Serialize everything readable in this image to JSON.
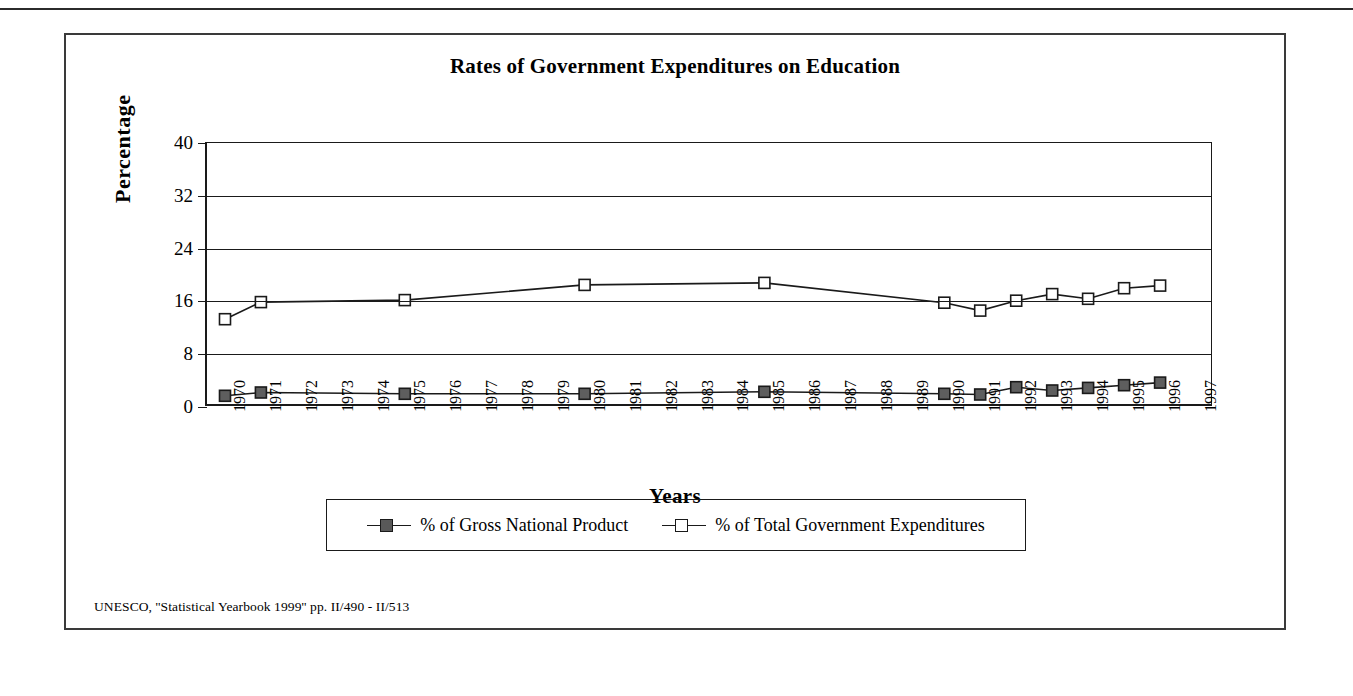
{
  "figure": {
    "title": "Rates of Government Expenditures on Education",
    "source_note": "UNESCO, ''Statistical Yearbook 1999'' pp. II/490 - II/513"
  },
  "legend": {
    "entries": [
      {
        "label": "% of Gross National Product",
        "marker": "filled-square",
        "color": "#595959"
      },
      {
        "label": "% of Total Government Expenditures",
        "marker": "open-square",
        "color": "#ffffff"
      }
    ]
  },
  "chart_data": {
    "type": "line",
    "title": "Rates of Government Expenditures on Education",
    "xlabel": "Years",
    "ylabel": "Percentage",
    "xlim": [
      "1970",
      "1997"
    ],
    "ylim": [
      0,
      40
    ],
    "yticks": [
      0,
      8,
      16,
      24,
      32,
      40
    ],
    "grid": true,
    "legend_position": "bottom",
    "categories": [
      "1970",
      "1971",
      "1972",
      "1973",
      "1974",
      "1975",
      "1976",
      "1977",
      "1978",
      "1979",
      "1980",
      "1981",
      "1982",
      "1983",
      "1984",
      "1985",
      "1986",
      "1987",
      "1988",
      "1989",
      "1990",
      "1991",
      "1992",
      "1993",
      "1994",
      "1995",
      "1996",
      "1997"
    ],
    "series": [
      {
        "name": "% of Gross National Product",
        "marker": "filled-square",
        "points": [
          {
            "x": "1970",
            "y": 1.7
          },
          {
            "x": "1971",
            "y": 2.2
          },
          {
            "x": "1975",
            "y": 2.0
          },
          {
            "x": "1980",
            "y": 2.0
          },
          {
            "x": "1985",
            "y": 2.3
          },
          {
            "x": "1990",
            "y": 2.0
          },
          {
            "x": "1991",
            "y": 1.9
          },
          {
            "x": "1992",
            "y": 3.0
          },
          {
            "x": "1993",
            "y": 2.5
          },
          {
            "x": "1994",
            "y": 2.9
          },
          {
            "x": "1995",
            "y": 3.3
          },
          {
            "x": "1996",
            "y": 3.7
          }
        ]
      },
      {
        "name": "% of Total Government Expenditures",
        "marker": "open-square",
        "points": [
          {
            "x": "1970",
            "y": 13.3
          },
          {
            "x": "1971",
            "y": 15.9
          },
          {
            "x": "1975",
            "y": 16.2
          },
          {
            "x": "1980",
            "y": 18.5
          },
          {
            "x": "1985",
            "y": 18.8
          },
          {
            "x": "1990",
            "y": 15.8
          },
          {
            "x": "1991",
            "y": 14.6
          },
          {
            "x": "1992",
            "y": 16.1
          },
          {
            "x": "1993",
            "y": 17.1
          },
          {
            "x": "1994",
            "y": 16.4
          },
          {
            "x": "1995",
            "y": 18.0
          },
          {
            "x": "1996",
            "y": 18.4
          }
        ]
      }
    ]
  }
}
